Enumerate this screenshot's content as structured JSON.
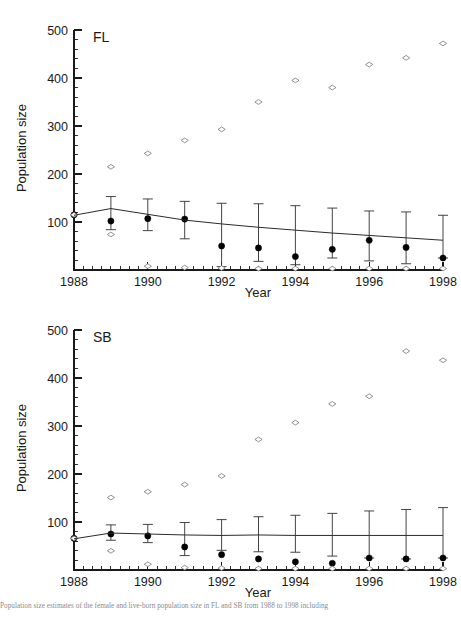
{
  "figure": {
    "caption": "Population size estimates of the female and live-born population size in FL and SB from 1988 to 1998 including"
  },
  "axes": {
    "ylabel": "Population size",
    "xlabel": "Year",
    "y_ticks": [
      100,
      200,
      300,
      400,
      500
    ],
    "y_tick_labels": [
      "100",
      "200",
      "300",
      "400",
      "500"
    ],
    "x_ticks": [
      1988,
      1990,
      1992,
      1994,
      1996,
      1998
    ],
    "x_tick_labels": [
      "1988",
      "1990",
      "1992",
      "1994",
      "1996",
      "1998"
    ],
    "ylim": [
      0,
      500
    ],
    "xlim": [
      1988,
      1998
    ],
    "y_minor_step": 20,
    "x_minor_step": 0.25,
    "grid": false
  },
  "chart_data": [
    {
      "type": "scatter",
      "panel_label": "FL",
      "title": "FL",
      "xlabel": "Year",
      "ylabel": "Population size",
      "xlim": [
        1988,
        1998
      ],
      "ylim": [
        0,
        500
      ],
      "grid": false,
      "legend": "none",
      "x": [
        1988,
        1989,
        1990,
        1991,
        1992,
        1993,
        1994,
        1995,
        1996,
        1997,
        1998
      ],
      "series": [
        {
          "name": "upper-bound-open-diamond",
          "marker": "open-diamond",
          "values": [
            115,
            215,
            243,
            270,
            293,
            350,
            395,
            380,
            428,
            442,
            472
          ]
        },
        {
          "name": "estimate-filled-circle",
          "marker": "filled-circle",
          "values": [
            115,
            102,
            107,
            106,
            50,
            46,
            28,
            43,
            62,
            47,
            25
          ]
        },
        {
          "name": "lower-bound-open-diamond",
          "marker": "open-diamond",
          "values": [
            115,
            74,
            8,
            5,
            4,
            3,
            3,
            3,
            3,
            3,
            3
          ]
        },
        {
          "name": "fitted-trend-line",
          "marker": "line",
          "values": [
            114,
            128,
            116,
            104,
            96,
            89,
            83,
            77,
            72,
            67,
            62
          ]
        }
      ],
      "error_bars": {
        "name": "95-percent-confidence-interval",
        "x": [
          1989,
          1990,
          1991,
          1992,
          1993,
          1994,
          1995,
          1996,
          1997,
          1998
        ],
        "lower": [
          84,
          82,
          65,
          7,
          18,
          11,
          25,
          19,
          13,
          25
        ],
        "upper": [
          153,
          148,
          143,
          139,
          138,
          134,
          129,
          123,
          121,
          114
        ]
      }
    },
    {
      "type": "scatter",
      "panel_label": "SB",
      "title": "SB",
      "xlabel": "Year",
      "ylabel": "Population size",
      "xlim": [
        1988,
        1998
      ],
      "ylim": [
        0,
        500
      ],
      "grid": false,
      "legend": "none",
      "x": [
        1988,
        1989,
        1990,
        1991,
        1992,
        1993,
        1994,
        1995,
        1996,
        1997,
        1998
      ],
      "series": [
        {
          "name": "upper-bound-open-diamond",
          "marker": "open-diamond",
          "values": [
            66,
            151,
            163,
            178,
            196,
            272,
            307,
            346,
            362,
            456,
            437
          ]
        },
        {
          "name": "estimate-filled-circle",
          "marker": "filled-circle",
          "values": [
            66,
            75,
            71,
            48,
            32,
            23,
            17,
            14,
            25,
            23,
            25
          ]
        },
        {
          "name": "lower-bound-open-diamond",
          "marker": "open-diamond",
          "values": [
            66,
            40,
            12,
            5,
            4,
            3,
            3,
            3,
            3,
            3,
            3
          ]
        },
        {
          "name": "fitted-trend-line",
          "marker": "line",
          "values": [
            65,
            77,
            75,
            73,
            72,
            73,
            72,
            72,
            72,
            72,
            72
          ]
        }
      ],
      "error_bars": {
        "name": "95-percent-confidence-interval",
        "x": [
          1989,
          1990,
          1991,
          1992,
          1993,
          1994,
          1995,
          1996,
          1997,
          1998
        ],
        "lower": [
          62,
          57,
          30,
          41,
          38,
          37,
          29,
          25,
          23,
          25
        ],
        "upper": [
          94,
          95,
          99,
          105,
          111,
          114,
          118,
          123,
          126,
          130
        ]
      }
    }
  ]
}
